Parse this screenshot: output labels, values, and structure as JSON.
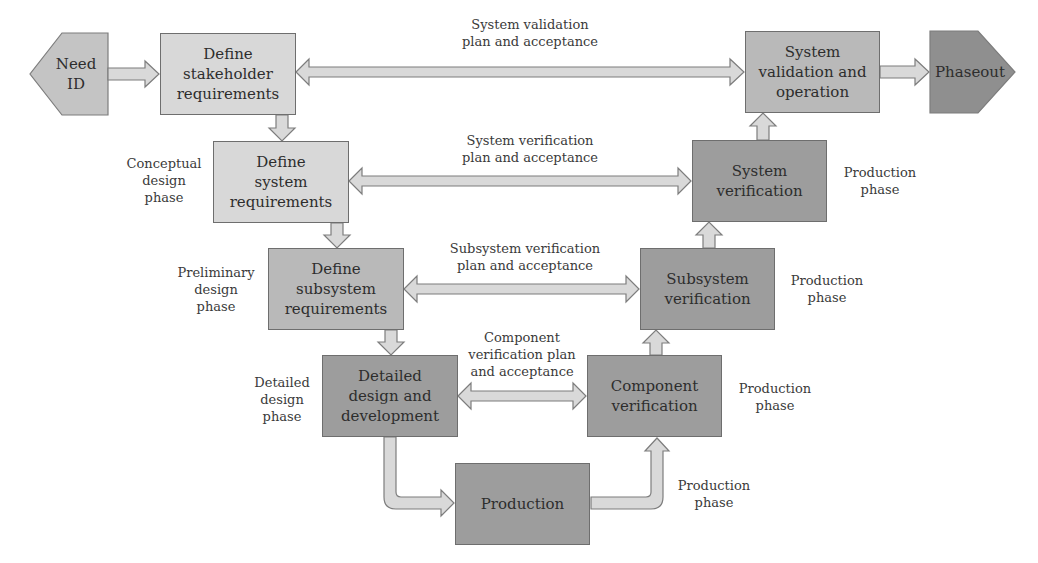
{
  "diagram": {
    "colors": {
      "light_box": "#d8d8d8",
      "mid_box": "#b9b9b9",
      "dark_box": "#9d9d9d",
      "phaseout": "#8c8c8c",
      "arrow_fill": "#d9d9d9",
      "border": "#6e6e6e"
    },
    "terminals": {
      "need_id": "Need ID",
      "phaseout": "Phaseout"
    },
    "left_boxes": [
      {
        "id": "stakeholder",
        "lines": [
          "Define",
          "stakeholder",
          "requirements"
        ]
      },
      {
        "id": "system_req",
        "lines": [
          "Define",
          "system",
          "requirements"
        ]
      },
      {
        "id": "subsystem_req",
        "lines": [
          "Define",
          "subsystem",
          "requirements"
        ]
      },
      {
        "id": "detailed_design",
        "lines": [
          "Detailed",
          "design and",
          "development"
        ]
      }
    ],
    "right_boxes": [
      {
        "id": "validation",
        "lines": [
          "System",
          "validation and",
          "operation"
        ]
      },
      {
        "id": "system_ver",
        "lines": [
          "System",
          "verification"
        ]
      },
      {
        "id": "subsystem_ver",
        "lines": [
          "Subsystem",
          "verification"
        ]
      },
      {
        "id": "component_ver",
        "lines": [
          "Component",
          "verification"
        ]
      }
    ],
    "bottom_box": {
      "id": "production",
      "label": "Production"
    },
    "connector_labels": [
      {
        "lines": [
          "System validation",
          "plan and acceptance"
        ]
      },
      {
        "lines": [
          "System verification",
          "plan and acceptance"
        ]
      },
      {
        "lines": [
          "Subsystem verification",
          "plan and acceptance"
        ]
      },
      {
        "lines": [
          "Component",
          "verification plan",
          "and acceptance"
        ]
      }
    ],
    "phase_labels_left": [
      {
        "lines": [
          "Conceptual",
          "design",
          "phase"
        ]
      },
      {
        "lines": [
          "Preliminary",
          "design",
          "phase"
        ]
      },
      {
        "lines": [
          "Detailed",
          "design",
          "phase"
        ]
      }
    ],
    "phase_labels_right": [
      {
        "lines": [
          "Production",
          "phase"
        ]
      },
      {
        "lines": [
          "Production",
          "phase"
        ]
      },
      {
        "lines": [
          "Production",
          "phase"
        ]
      },
      {
        "lines": [
          "Production",
          "phase"
        ]
      }
    ]
  }
}
